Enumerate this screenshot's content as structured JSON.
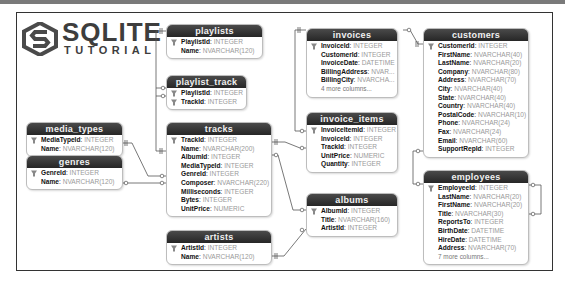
{
  "logo": {
    "main": "SQLITE",
    "sub": "TUTORIAL"
  },
  "colors": {
    "header": "#2e2e2e",
    "line": "#555555",
    "type_text": "#9a9a9a"
  },
  "tables": {
    "playlists": {
      "name": "playlists",
      "columns": [
        {
          "name": "PlaylistId",
          "type": "INTEGER",
          "pk": true
        },
        {
          "name": "Name",
          "type": "NVARCHAR(120)"
        }
      ]
    },
    "playlist_track": {
      "name": "playlist_track",
      "columns": [
        {
          "name": "PlaylistId",
          "type": "INTEGER",
          "pk": true
        },
        {
          "name": "TrackId",
          "type": "INTEGER",
          "pk": true
        }
      ]
    },
    "media_types": {
      "name": "media_types",
      "columns": [
        {
          "name": "MediaTypeId",
          "type": "INTEGER",
          "pk": true
        },
        {
          "name": "Name",
          "type": "NVARCHAR(120)"
        }
      ]
    },
    "genres": {
      "name": "genres",
      "columns": [
        {
          "name": "GenreId",
          "type": "INTEGER",
          "pk": true
        },
        {
          "name": "Name",
          "type": "NVARCHAR(120)"
        }
      ]
    },
    "tracks": {
      "name": "tracks",
      "columns": [
        {
          "name": "TrackId",
          "type": "INTEGER",
          "pk": true
        },
        {
          "name": "Name",
          "type": "NVARCHAR(200)"
        },
        {
          "name": "AlbumId",
          "type": "INTEGER"
        },
        {
          "name": "MediaTypeId",
          "type": "INTEGER"
        },
        {
          "name": "GenreId",
          "type": "INTEGER"
        },
        {
          "name": "Composer",
          "type": "NVARCHAR(220)"
        },
        {
          "name": "Milliseconds",
          "type": "INTEGER"
        },
        {
          "name": "Bytes",
          "type": "INTEGER"
        },
        {
          "name": "UnitPrice",
          "type": "NUMERIC"
        }
      ]
    },
    "artists": {
      "name": "artists",
      "columns": [
        {
          "name": "ArtistId",
          "type": "INTEGER",
          "pk": true
        },
        {
          "name": "Name",
          "type": "NVARCHAR(120)"
        }
      ]
    },
    "invoices": {
      "name": "invoices",
      "columns": [
        {
          "name": "InvoiceId",
          "type": "INTEGER",
          "pk": true
        },
        {
          "name": "CustomerId",
          "type": "INTEGER"
        },
        {
          "name": "InvoiceDate",
          "type": "DATETIME"
        },
        {
          "name": "BillingAddress",
          "type": "NVAR..."
        },
        {
          "name": "BillingCity",
          "type": "NVARCHA..."
        }
      ],
      "more": "4 more columns..."
    },
    "invoice_items": {
      "name": "invoice_items",
      "columns": [
        {
          "name": "InvoiceItemId",
          "type": "INTEGER",
          "pk": true
        },
        {
          "name": "InvoiceId",
          "type": "INTEGER"
        },
        {
          "name": "TrackId",
          "type": "INTEGER"
        },
        {
          "name": "UnitPrice",
          "type": "NUMERIC"
        },
        {
          "name": "Quantity",
          "type": "INTEGER"
        }
      ]
    },
    "albums": {
      "name": "albums",
      "columns": [
        {
          "name": "AlbumId",
          "type": "INTEGER",
          "pk": true
        },
        {
          "name": "Title",
          "type": "NVARCHAR(160)"
        },
        {
          "name": "ArtistId",
          "type": "INTEGER"
        }
      ]
    },
    "customers": {
      "name": "customers",
      "columns": [
        {
          "name": "CustomerId",
          "type": "INTEGER",
          "pk": true
        },
        {
          "name": "FirstName",
          "type": "NVARCHAR(40)"
        },
        {
          "name": "LastName",
          "type": "NVARCHAR(20)"
        },
        {
          "name": "Company",
          "type": "NVARCHAR(80)"
        },
        {
          "name": "Address",
          "type": "NVARCHAR(70)"
        },
        {
          "name": "City",
          "type": "NVARCHAR(40)"
        },
        {
          "name": "State",
          "type": "NVARCHAR(40)"
        },
        {
          "name": "Country",
          "type": "NVARCHAR(40)"
        },
        {
          "name": "PostalCode",
          "type": "NVARCHAR(10)"
        },
        {
          "name": "Phone",
          "type": "NVARCHAR(24)"
        },
        {
          "name": "Fax",
          "type": "NVARCHAR(24)"
        },
        {
          "name": "Email",
          "type": "NVARCHAR(60)"
        },
        {
          "name": "SupportRepId",
          "type": "INTEGER"
        }
      ]
    },
    "employees": {
      "name": "employees",
      "columns": [
        {
          "name": "EmployeeId",
          "type": "INTEGER",
          "pk": true
        },
        {
          "name": "LastName",
          "type": "NVARCHAR(20)"
        },
        {
          "name": "FirstName",
          "type": "NVARCHAR(20)"
        },
        {
          "name": "Title",
          "type": "NVARCHAR(30)"
        },
        {
          "name": "ReportsTo",
          "type": "INTEGER"
        },
        {
          "name": "BirthDate",
          "type": "DATETIME"
        },
        {
          "name": "HireDate",
          "type": "DATETIME"
        },
        {
          "name": "Address",
          "type": "NVARCHAR(70)"
        }
      ],
      "more": "7 more columns..."
    }
  },
  "relationships": [
    {
      "from": "playlists.PlaylistId",
      "to": "playlist_track.PlaylistId",
      "kind": "one-to-many"
    },
    {
      "from": "tracks.TrackId",
      "to": "playlist_track.TrackId",
      "kind": "one-to-many"
    },
    {
      "from": "media_types.MediaTypeId",
      "to": "tracks.MediaTypeId",
      "kind": "one-to-many"
    },
    {
      "from": "genres.GenreId",
      "to": "tracks.GenreId",
      "kind": "zero-or-one-to-many"
    },
    {
      "from": "tracks.TrackId",
      "to": "invoice_items.TrackId",
      "kind": "one-to-many"
    },
    {
      "from": "albums.AlbumId",
      "to": "tracks.AlbumId",
      "kind": "one-to-many"
    },
    {
      "from": "artists.ArtistId",
      "to": "albums.ArtistId",
      "kind": "one-to-many"
    },
    {
      "from": "invoices.InvoiceId",
      "to": "invoice_items.InvoiceId",
      "kind": "one-to-many"
    },
    {
      "from": "customers.CustomerId",
      "to": "invoices.CustomerId",
      "kind": "one-to-many"
    },
    {
      "from": "employees.EmployeeId",
      "to": "customers.SupportRepId",
      "kind": "zero-or-one-to-many"
    },
    {
      "from": "employees.EmployeeId",
      "to": "employees.ReportsTo",
      "kind": "zero-or-one-to-many"
    }
  ]
}
